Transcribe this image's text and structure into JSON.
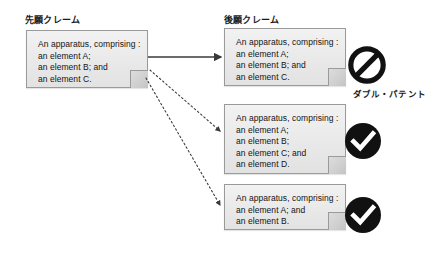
{
  "diagram": {
    "columns": {
      "prior": {
        "heading": "先願クレーム"
      },
      "later": {
        "heading": "後願クレーム"
      }
    },
    "prior_claim": {
      "text": "An apparatus, comprising :\nan element A;\nan element B; and\nan element C."
    },
    "later_claims": [
      {
        "text": "An apparatus, comprising :\nan element A;\nan element B; and\nan element C.",
        "verdict_icon": "prohibition-icon",
        "verdict_label": "ダブル・パテント",
        "connector": "solid-arrow"
      },
      {
        "text": "An apparatus, comprising :\nan element A;\nan element B;\nan element C; and\nan element D.",
        "verdict_icon": "check-icon",
        "verdict_label": "",
        "connector": "dotted-arrow"
      },
      {
        "text": "An apparatus, comprising :\nan element A; and\nan element B.",
        "verdict_icon": "check-icon",
        "verdict_label": "",
        "connector": "dotted-arrow"
      }
    ],
    "colors": {
      "background": "#ffffff",
      "box_fill": "#ebebeb",
      "box_border": "#9a9a9a",
      "text": "#141414",
      "icon": "#111111",
      "connector": "#3a3a3a"
    }
  }
}
